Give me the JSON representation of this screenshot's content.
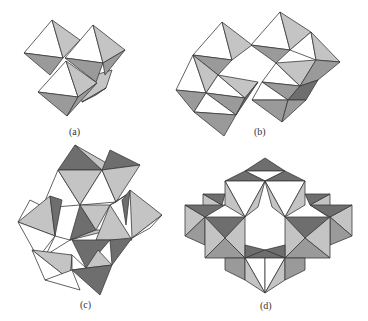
{
  "figure": {
    "panels": [
      {
        "id": "a",
        "label": "(a)",
        "description": "Edge-sharing cluster of four octahedra"
      },
      {
        "id": "b",
        "label": "(b)",
        "description": "Two linked octahedral clusters"
      },
      {
        "id": "c",
        "label": "(c)",
        "description": "Condensed polyhedral cluster"
      },
      {
        "id": "d",
        "label": "(d)",
        "description": "Ring of octahedra around a hexagonal cavity"
      }
    ],
    "colors": {
      "face_white": "#ffffff",
      "face_light": "#c4c4c4",
      "face_mid": "#9a9a9a",
      "face_dark": "#6e6e6e",
      "edge": "#3a3a3a"
    }
  }
}
